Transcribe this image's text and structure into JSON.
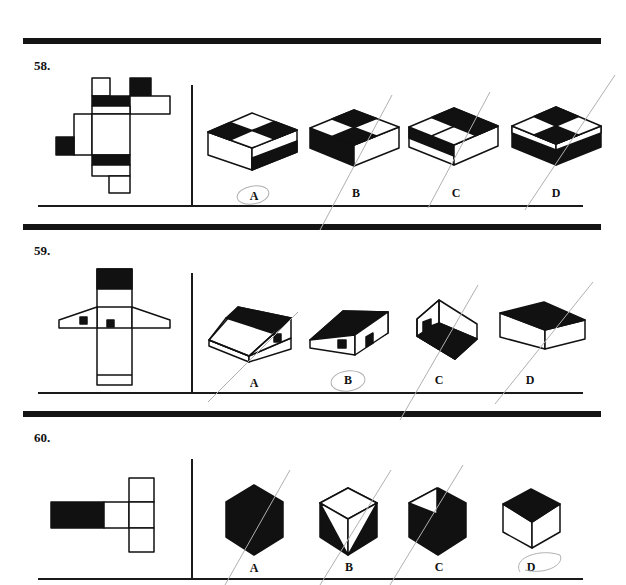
{
  "questions": [
    {
      "number": "58.",
      "options": [
        "A",
        "B",
        "C",
        "D"
      ],
      "marked_answer": "A"
    },
    {
      "number": "59.",
      "options": [
        "A",
        "B",
        "C",
        "D"
      ],
      "marked_answer": "B"
    },
    {
      "number": "60.",
      "options": [
        "A",
        "B",
        "C",
        "D"
      ],
      "marked_answer": "D"
    }
  ],
  "colors": {
    "ink": "#111111",
    "paper": "#ffffff",
    "pencil": "#b0b0b0"
  }
}
